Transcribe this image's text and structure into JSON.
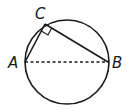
{
  "diagram": {
    "type": "circle-inscribed-right-triangle",
    "labels": {
      "a": "A",
      "b": "B",
      "c": "C"
    },
    "segments": [
      {
        "from": "A",
        "to": "C",
        "style": "solid"
      },
      {
        "from": "C",
        "to": "B",
        "style": "solid"
      },
      {
        "from": "A",
        "to": "B",
        "style": "dashed"
      }
    ],
    "right_angle_at": "C",
    "colors": {
      "stroke": "#1a1a1a",
      "background": "#ffffff"
    }
  }
}
